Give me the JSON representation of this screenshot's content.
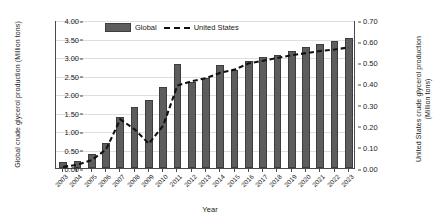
{
  "chart_data": {
    "type": "bar",
    "title": "",
    "xlabel": "Year",
    "ylabel": "Global crude glycerol production (Million tons)",
    "ylabel_right": "United States crude glycerol production (Million tons)",
    "grid": true,
    "legend_position": "top-center",
    "categories": [
      "2003",
      "2004",
      "2005",
      "2006",
      "2007",
      "2008",
      "2009",
      "2010",
      "2011",
      "2012",
      "2013",
      "2014",
      "2015",
      "2016",
      "2017",
      "2018",
      "2019",
      "2020",
      "2021",
      "2022",
      "2023"
    ],
    "ylim": [
      0.0,
      4.0
    ],
    "yticks": [
      "0.00",
      "0.50",
      "1.00",
      "1.50",
      "2.00",
      "2.50",
      "3.00",
      "3.50",
      "4.00"
    ],
    "ylim_right": [
      0.0,
      0.7
    ],
    "yticks_right": [
      "0.00",
      "0.10",
      "0.20",
      "0.30",
      "0.40",
      "0.50",
      "0.60",
      "0.70"
    ],
    "series": [
      {
        "name": "Global",
        "type": "bar",
        "axis": "left",
        "color": "#5d5d5d",
        "values": [
          0.15,
          0.18,
          0.37,
          0.67,
          1.38,
          1.66,
          1.83,
          2.18,
          2.8,
          2.33,
          2.42,
          2.78,
          2.66,
          2.9,
          2.99,
          3.05,
          3.17,
          3.27,
          3.36,
          3.42,
          3.52
        ]
      },
      {
        "name": "United States",
        "type": "line",
        "axis": "right",
        "color": "#111111",
        "style": "dashed",
        "values": [
          0.01,
          0.02,
          0.042,
          0.092,
          0.235,
          0.188,
          0.12,
          0.205,
          0.395,
          0.415,
          0.43,
          0.455,
          0.47,
          0.5,
          0.512,
          0.525,
          0.538,
          0.548,
          0.558,
          0.565,
          0.575
        ]
      }
    ]
  },
  "legend": {
    "items": [
      {
        "label": "Global",
        "icon": "bar-swatch"
      },
      {
        "label": "United States",
        "icon": "dashed-line-swatch"
      }
    ]
  }
}
